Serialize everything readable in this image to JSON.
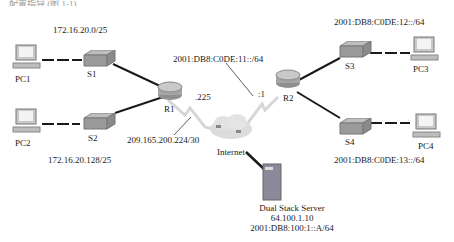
{
  "header_fragment": "…配置指导 (图 1-1)",
  "devices": {
    "pc1": {
      "label": "PC1"
    },
    "pc2": {
      "label": "PC2"
    },
    "pc3": {
      "label": "PC3"
    },
    "pc4": {
      "label": "PC4"
    },
    "s1": {
      "label": "S1"
    },
    "s2": {
      "label": "S2"
    },
    "s3": {
      "label": "S3"
    },
    "s4": {
      "label": "S4"
    },
    "r1": {
      "label": "R1"
    },
    "r2": {
      "label": "R2"
    },
    "internet": {
      "label": "Internet"
    },
    "server": {
      "label": "Dual Stack Server",
      "ipv4": "64.100.1.10",
      "ipv6": "2001:DB8:100:1::A/64"
    }
  },
  "networks": {
    "lan1": "172.16.20.0/25",
    "lan2": "172.16.20.128/25",
    "wan_ipv4": "209.165.200.224/30",
    "wan_ipv6": "2001:DB8:C0DE:11::/64",
    "lan3": "2001:DB8:C0DE:12::/64",
    "lan4": "2001:DB8:C0DE:13::/64"
  },
  "interfaces": {
    "r1_wan_host": ".225",
    "r2_wan_host": ":1"
  },
  "colors": {
    "cable": "#1a1a1a",
    "serial": "#cfcfcf",
    "device_gray": "#9a9a9a",
    "server_body": "#8a8a9a"
  }
}
